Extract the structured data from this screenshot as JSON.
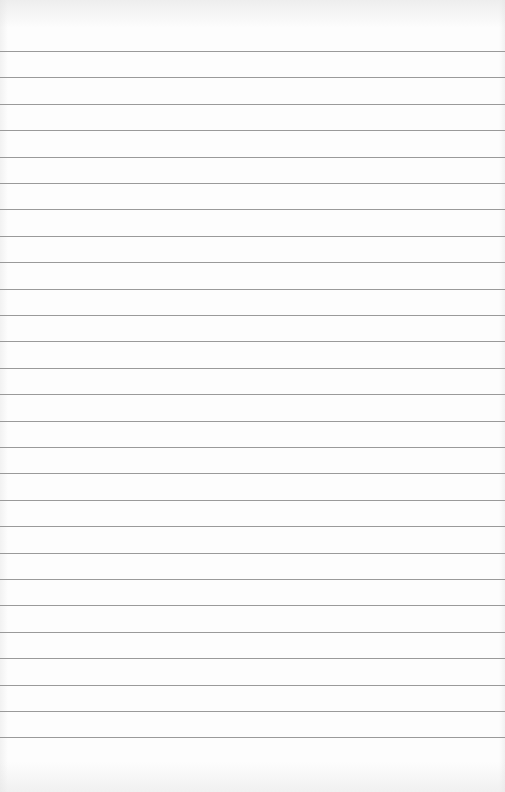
{
  "paper": {
    "type": "ruled-lined-sheet",
    "line_color": "#9a9a9a",
    "background_color": "#fdfdfd",
    "line_count": 27,
    "first_line_y": 51,
    "line_spacing": 26.4,
    "text_content": ""
  }
}
